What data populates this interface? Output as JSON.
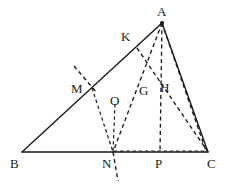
{
  "figure": {
    "background_color": "#ffffff",
    "stroke_color": "#1a1a1a",
    "width": 227,
    "height": 186
  },
  "points": {
    "A": {
      "label": "A",
      "x": 162,
      "y": 23,
      "label_x": 157,
      "label_y": 5,
      "kind": "vertex",
      "marked": true
    },
    "B": {
      "label": "B",
      "x": 22,
      "y": 152,
      "label_x": 10,
      "label_y": 157,
      "kind": "vertex",
      "marked": false
    },
    "C": {
      "label": "C",
      "x": 208,
      "y": 152,
      "label_x": 207,
      "label_y": 157,
      "kind": "vertex",
      "marked": false
    },
    "K": {
      "label": "K",
      "x": 137,
      "y": 48,
      "label_x": 121,
      "label_y": 30,
      "kind": "point-on-side",
      "marked": false
    },
    "M": {
      "label": "M",
      "x": 92,
      "y": 88,
      "label_x": 71,
      "label_y": 82,
      "kind": "point-on-side",
      "marked": false
    },
    "O": {
      "label": "O",
      "x": 115,
      "y": 106,
      "label_x": 110,
      "label_y": 94,
      "kind": "intersection",
      "marked": false
    },
    "G": {
      "label": "G",
      "x": 146,
      "y": 97,
      "label_x": 139,
      "label_y": 84,
      "kind": "intersection",
      "marked": false
    },
    "H": {
      "label": "H",
      "x": 162,
      "y": 90,
      "label_x": 160,
      "label_y": 81,
      "kind": "intersection",
      "marked": false
    },
    "N": {
      "label": "N",
      "x": 113,
      "y": 152,
      "label_x": 102,
      "label_y": 157,
      "kind": "foot-on-base",
      "marked": false
    },
    "P": {
      "label": "P",
      "x": 160,
      "y": 152,
      "label_x": 155,
      "label_y": 157,
      "kind": "foot-on-base",
      "marked": false
    }
  },
  "segments": {
    "solid": [
      {
        "name": "side-AB",
        "from": "A",
        "to": "B",
        "x1": 162,
        "y1": 23,
        "x2": 22,
        "y2": 152
      },
      {
        "name": "side-BC",
        "from": "B",
        "to": "C",
        "x1": 22,
        "y1": 152,
        "x2": 208,
        "y2": 152
      },
      {
        "name": "side-AC",
        "from": "A",
        "to": "C",
        "x1": 162,
        "y1": 23,
        "x2": 208,
        "y2": 152
      }
    ],
    "dashed": [
      {
        "name": "cevian-A-N",
        "from": "A",
        "to": "N",
        "x1": 162,
        "y1": 23,
        "x2": 113,
        "y2": 152
      },
      {
        "name": "altitude-A-P",
        "from": "A",
        "to": "P",
        "x1": 162,
        "y1": 23,
        "x2": 160,
        "y2": 152
      },
      {
        "name": "cevian-N-A-through-G",
        "from": "N",
        "to": "A",
        "x1": 113,
        "y1": 152,
        "x2": 162,
        "y2": 23
      },
      {
        "name": "cevian-K-C",
        "from": "K",
        "to": "C",
        "x1": 137,
        "y1": 48,
        "x2": 208,
        "y2": 152
      },
      {
        "name": "cevian-N-C-low",
        "from": "N",
        "to": "C",
        "x1": 113,
        "y1": 152,
        "x2": 208,
        "y2": 152
      },
      {
        "name": "segment-M-N",
        "from": "M",
        "to": "N",
        "x1": 92,
        "y1": 88,
        "x2": 113,
        "y2": 152
      },
      {
        "name": "segment-O-N",
        "from": "O",
        "to": "N",
        "x1": 115,
        "y1": 106,
        "x2": 113,
        "y2": 152
      },
      {
        "name": "perp-bisector-upper",
        "from": "above-M",
        "to": "M",
        "x1": 74,
        "y1": 66,
        "x2": 96,
        "y2": 92
      },
      {
        "name": "perp-bisector-lower",
        "from": "N",
        "to": "below-N",
        "x1": 113,
        "y1": 152,
        "x2": 118,
        "y2": 181
      }
    ]
  },
  "labels_order": [
    "A",
    "K",
    "M",
    "O",
    "G",
    "H",
    "B",
    "N",
    "P",
    "C"
  ]
}
